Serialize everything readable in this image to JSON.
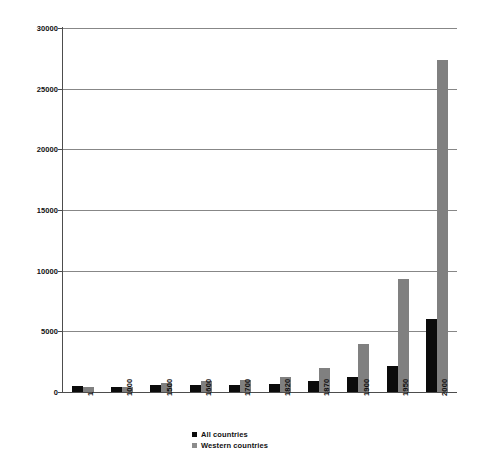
{
  "chart_data": {
    "type": "bar",
    "title": "",
    "subtitle": "",
    "xlabel": "",
    "ylabel": "",
    "categories": [
      "1",
      "1000",
      "1500",
      "1600",
      "1700",
      "1820",
      "1870",
      "1900",
      "1950",
      "2000"
    ],
    "series": [
      {
        "name": "All countries",
        "color": "#0b0b0b",
        "values": [
          467,
          450,
          566,
          596,
          616,
          667,
          870,
          1262,
          2111,
          6038
        ]
      },
      {
        "name": "Western countries",
        "color": "#808080",
        "values": [
          443,
          400,
          771,
          889,
          997,
          1202,
          1960,
          3988,
          9288,
          27400
        ]
      }
    ],
    "ylim": [
      0,
      30000
    ],
    "yticks": [
      0,
      5000,
      10000,
      15000,
      20000,
      25000,
      30000
    ],
    "ytick_labels": [
      "0",
      "5000",
      "10000",
      "15000",
      "20000",
      "25000",
      "30000"
    ],
    "grid": "horizontal",
    "legend_position": "bottom-center",
    "xtick_rotation": -90
  },
  "legend": {
    "items": [
      {
        "label": "All countries",
        "swatch": "all"
      },
      {
        "label": "Western countries",
        "swatch": "west"
      }
    ]
  }
}
